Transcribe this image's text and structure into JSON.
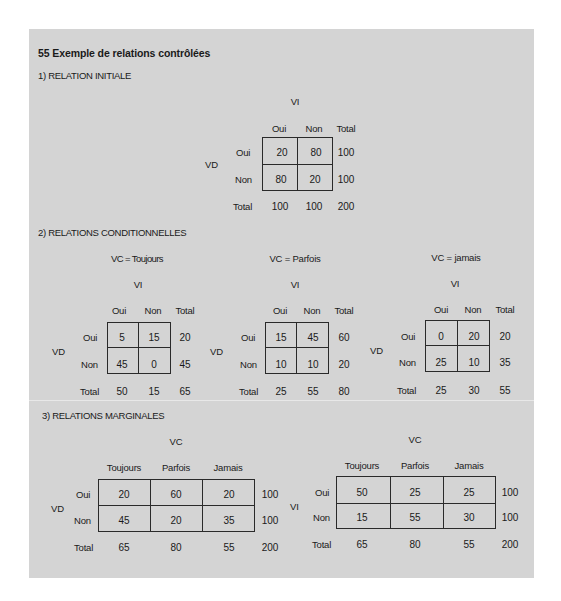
{
  "title": "55   Exemple de relations contrôlées",
  "section1": {
    "heading": "1)  RELATION INITIALE",
    "col_var": "VI",
    "row_var": "VD",
    "col_headers": [
      "Oui",
      "Non",
      "Total"
    ],
    "rows": [
      {
        "label": "Oui",
        "values": [
          "20",
          "80"
        ],
        "total": "100"
      },
      {
        "label": "Non",
        "values": [
          "80",
          "20"
        ],
        "total": "100"
      }
    ],
    "totals": {
      "label": "Total",
      "values": [
        "100",
        "100",
        "200"
      ]
    }
  },
  "section2": {
    "heading": "2)  RELATIONS CONDITIONNELLES",
    "tables": [
      {
        "condition": "VC = Toujours",
        "col_var": "VI",
        "row_var": "VD",
        "col_headers": [
          "Oui",
          "Non",
          "Total"
        ],
        "rows": [
          {
            "label": "Oui",
            "values": [
              "5",
              "15"
            ],
            "total": "20"
          },
          {
            "label": "Non",
            "values": [
              "45",
              "0"
            ],
            "total": "45"
          }
        ],
        "totals": {
          "label": "Total",
          "values": [
            "50",
            "15",
            "65"
          ]
        }
      },
      {
        "condition": "VC = Parfois",
        "col_var": "VI",
        "row_var": "VD",
        "col_headers": [
          "Oui",
          "Non",
          "Total"
        ],
        "rows": [
          {
            "label": "Oui",
            "values": [
              "15",
              "45"
            ],
            "total": "60"
          },
          {
            "label": "Non",
            "values": [
              "10",
              "10"
            ],
            "total": "20"
          }
        ],
        "totals": {
          "label": "Total",
          "values": [
            "25",
            "55",
            "80"
          ]
        }
      },
      {
        "condition": "VC = jamais",
        "col_var": "VI",
        "row_var": "VD",
        "col_headers": [
          "Oui",
          "Non",
          "Total"
        ],
        "rows": [
          {
            "label": "Oui",
            "values": [
              "0",
              "20"
            ],
            "total": "20"
          },
          {
            "label": "Non",
            "values": [
              "25",
              "10"
            ],
            "total": "35"
          }
        ],
        "totals": {
          "label": "Total",
          "values": [
            "25",
            "30",
            "55"
          ]
        }
      }
    ]
  },
  "section3": {
    "heading": "3)  RELATIONS MARGINALES",
    "tables": [
      {
        "col_var": "VC",
        "row_var": "VD",
        "col_headers": [
          "Toujours",
          "Parfois",
          "Jamais"
        ],
        "rows": [
          {
            "label": "Oui",
            "values": [
              "20",
              "60",
              "20"
            ],
            "total": "100"
          },
          {
            "label": "Non",
            "values": [
              "45",
              "20",
              "35"
            ],
            "total": "100"
          }
        ],
        "totals": {
          "label": "Total",
          "values": [
            "65",
            "80",
            "55",
            "200"
          ]
        }
      },
      {
        "col_var": "VC",
        "row_var": "VI",
        "col_headers": [
          "Toujours",
          "Parfois",
          "Jamais"
        ],
        "rows": [
          {
            "label": "Oui",
            "values": [
              "50",
              "25",
              "25"
            ],
            "total": "100"
          },
          {
            "label": "Non",
            "values": [
              "15",
              "55",
              "30"
            ],
            "total": "100"
          }
        ],
        "totals": {
          "label": "Total",
          "values": [
            "65",
            "80",
            "55",
            "200"
          ]
        }
      }
    ]
  }
}
